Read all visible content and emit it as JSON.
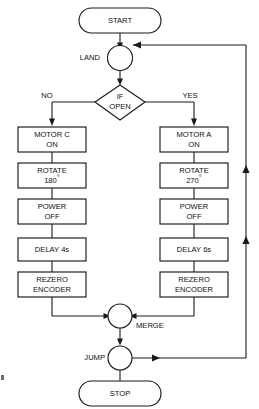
{
  "diagram": {
    "type": "flowchart",
    "colors": {
      "stroke": "#1a1a1a",
      "fill": "#ffffff",
      "text": "#101010",
      "background": "#ffffff"
    }
  },
  "nodes": {
    "start": {
      "label": "START",
      "shape": "terminator"
    },
    "land": {
      "label": "LAND",
      "shape": "connector-circle"
    },
    "decision": {
      "line1": "IF",
      "line2": "OPEN",
      "shape": "decision"
    },
    "left_branch_label": "NO",
    "right_branch_label": "YES",
    "left": [
      {
        "line1": "MOTOR C",
        "line2": "ON",
        "shape": "process"
      },
      {
        "line1": "ROTATE",
        "line2": "180",
        "degree": "°",
        "shape": "process"
      },
      {
        "line1": "POWER",
        "line2": "OFF",
        "shape": "process"
      },
      {
        "line1": "DELAY 4s",
        "line2": "",
        "shape": "process"
      },
      {
        "line1": "REZERO",
        "line2": "ENCODER",
        "shape": "process"
      }
    ],
    "right": [
      {
        "line1": "MOTOR A",
        "line2": "ON",
        "shape": "process"
      },
      {
        "line1": "ROTATE",
        "line2": "270",
        "degree": "°",
        "shape": "process"
      },
      {
        "line1": "POWER",
        "line2": "OFF",
        "shape": "process"
      },
      {
        "line1": "DELAY 6s",
        "line2": "",
        "shape": "process"
      },
      {
        "line1": "REZERO",
        "line2": "ENCODER",
        "shape": "process"
      }
    ],
    "merge": {
      "label": "MERGE",
      "shape": "connector-circle"
    },
    "jump": {
      "label": "JUMP",
      "shape": "connector-circle"
    },
    "stop": {
      "label": "STOP",
      "shape": "terminator"
    }
  },
  "edges": [
    {
      "from": "start",
      "to": "land",
      "label": ""
    },
    {
      "from": "land",
      "to": "decision",
      "label": ""
    },
    {
      "from": "decision",
      "to": "left.0",
      "label": "NO"
    },
    {
      "from": "decision",
      "to": "right.0",
      "label": "YES"
    },
    {
      "from": "left.4",
      "to": "merge",
      "label": ""
    },
    {
      "from": "right.4",
      "to": "merge",
      "label": ""
    },
    {
      "from": "merge",
      "to": "jump",
      "label": ""
    },
    {
      "from": "jump",
      "to": "stop",
      "label": ""
    },
    {
      "from": "jump",
      "to": "land",
      "label": ""
    }
  ]
}
